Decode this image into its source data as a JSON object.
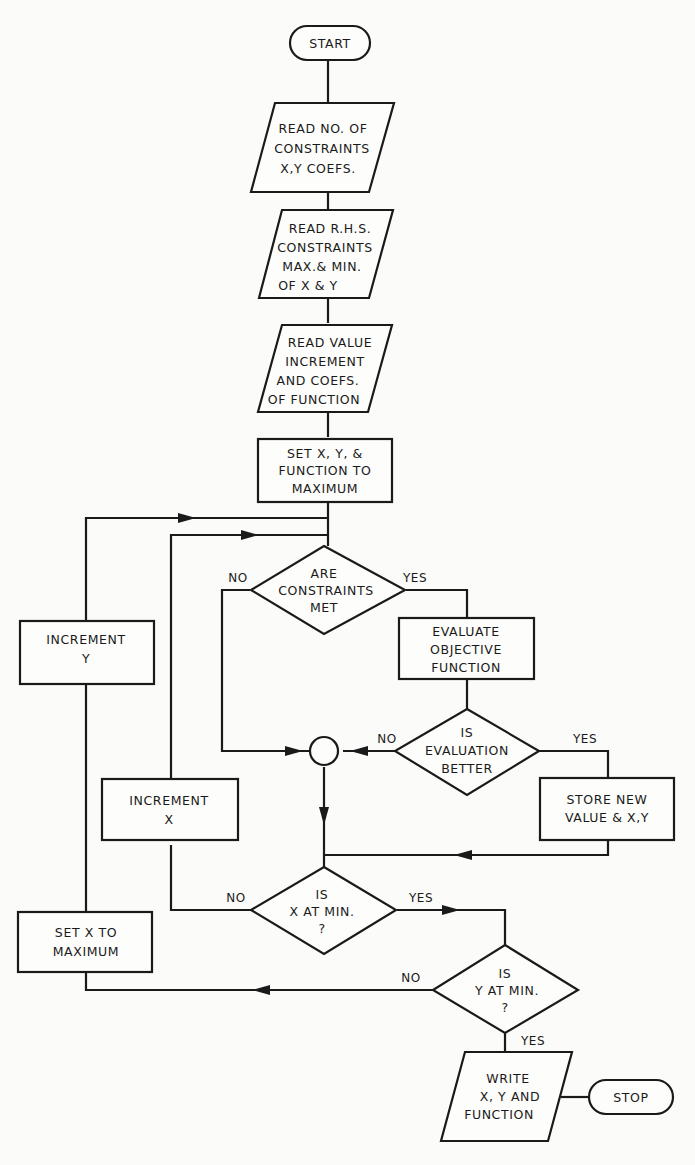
{
  "diagram": {
    "type": "flowchart",
    "nodes": {
      "start": {
        "kind": "terminator",
        "lines": [
          "START"
        ]
      },
      "read_constraints": {
        "kind": "input",
        "lines": [
          "READ NO. OF",
          "CONSTRAINTS",
          "X,Y COEFS."
        ]
      },
      "read_rhs": {
        "kind": "input",
        "lines": [
          "READ R.H.S.",
          "CONSTRAINTS",
          "MAX.& MIN.",
          "OF X & Y"
        ]
      },
      "read_value": {
        "kind": "input",
        "lines": [
          "READ VALUE",
          "INCREMENT",
          "AND COEFS.",
          "OF FUNCTION"
        ]
      },
      "set_xy": {
        "kind": "process",
        "lines": [
          "SET X, Y, &",
          "FUNCTION TO",
          "MAXIMUM"
        ]
      },
      "constraints_met": {
        "kind": "decision",
        "lines": [
          "ARE",
          "CONSTRAINTS",
          "MET"
        ]
      },
      "evaluate": {
        "kind": "process",
        "lines": [
          "EVALUATE",
          "OBJECTIVE",
          "FUNCTION"
        ]
      },
      "eval_better": {
        "kind": "decision",
        "lines": [
          "IS",
          "EVALUATION",
          "BETTER"
        ]
      },
      "store": {
        "kind": "process",
        "lines": [
          "STORE NEW",
          "VALUE & X,Y"
        ]
      },
      "increment_y": {
        "kind": "process",
        "lines": [
          "INCREMENT",
          "Y"
        ]
      },
      "increment_x": {
        "kind": "process",
        "lines": [
          "INCREMENT",
          "X"
        ]
      },
      "x_at_min": {
        "kind": "decision",
        "lines": [
          "IS",
          "X AT MIN.",
          "?"
        ]
      },
      "set_x_max": {
        "kind": "process",
        "lines": [
          "SET X TO",
          "MAXIMUM"
        ]
      },
      "y_at_min": {
        "kind": "decision",
        "lines": [
          "IS",
          "Y AT MIN.",
          "?"
        ]
      },
      "write": {
        "kind": "output",
        "lines": [
          "WRITE",
          "X, Y AND",
          "FUNCTION"
        ]
      },
      "stop": {
        "kind": "terminator",
        "lines": [
          "STOP"
        ]
      },
      "junction": {
        "kind": "connector",
        "lines": []
      }
    },
    "edge_labels": {
      "constraints_no": "NO",
      "constraints_yes": "YES",
      "better_no": "NO",
      "better_yes": "YES",
      "x_min_no": "NO",
      "x_min_yes": "YES",
      "y_min_no": "NO",
      "y_min_yes": "YES"
    },
    "edges": [
      {
        "from": "start",
        "to": "read_constraints"
      },
      {
        "from": "read_constraints",
        "to": "read_rhs"
      },
      {
        "from": "read_rhs",
        "to": "read_value"
      },
      {
        "from": "read_value",
        "to": "set_xy"
      },
      {
        "from": "set_xy",
        "to": "constraints_met"
      },
      {
        "from": "constraints_met",
        "to": "evaluate",
        "label": "YES"
      },
      {
        "from": "constraints_met",
        "to": "junction",
        "label": "NO"
      },
      {
        "from": "evaluate",
        "to": "eval_better"
      },
      {
        "from": "eval_better",
        "to": "store",
        "label": "YES"
      },
      {
        "from": "eval_better",
        "to": "junction",
        "label": "NO"
      },
      {
        "from": "junction",
        "to": "x_at_min"
      },
      {
        "from": "store",
        "to": "x_at_min"
      },
      {
        "from": "x_at_min",
        "to": "increment_x",
        "label": "NO"
      },
      {
        "from": "increment_x",
        "to": "constraints_met"
      },
      {
        "from": "x_at_min",
        "to": "y_at_min",
        "label": "YES"
      },
      {
        "from": "y_at_min",
        "to": "set_x_max",
        "label": "NO"
      },
      {
        "from": "set_x_max",
        "to": "increment_y"
      },
      {
        "from": "increment_y",
        "to": "constraints_met"
      },
      {
        "from": "y_at_min",
        "to": "write",
        "label": "YES"
      },
      {
        "from": "write",
        "to": "stop"
      }
    ]
  }
}
